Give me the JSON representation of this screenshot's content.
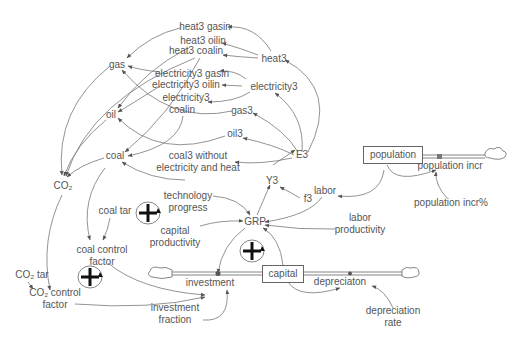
{
  "diagram": {
    "type": "stock-and-flow",
    "colors": {
      "line": "#777777",
      "text": "#555555",
      "stock_border": "#666666",
      "background": "#ffffff"
    },
    "stocks": [
      {
        "id": "population",
        "label": "population"
      },
      {
        "id": "capital",
        "label": "capital"
      }
    ],
    "flows": [
      {
        "id": "population_incr",
        "label": "population incr"
      },
      {
        "id": "investment",
        "label": "investment"
      },
      {
        "id": "depreciaton",
        "label": "depreciaton"
      }
    ],
    "variables": [
      {
        "id": "heat3_gasin",
        "label": "heat3 gasin"
      },
      {
        "id": "heat3_oilin",
        "label": "heat3 oilin"
      },
      {
        "id": "heat3_coalin",
        "label": "heat3 coalin"
      },
      {
        "id": "heat3",
        "label": "heat3"
      },
      {
        "id": "gas",
        "label": "gas"
      },
      {
        "id": "electricity3_gasin",
        "label": "electricity3 gasin"
      },
      {
        "id": "electricity3_oilin",
        "label": "electricity3 oilin"
      },
      {
        "id": "electricity3",
        "label": "electricity3"
      },
      {
        "id": "electricity3_coalin_1",
        "label": "electricity3"
      },
      {
        "id": "electricity3_coalin_2",
        "label": "coalin"
      },
      {
        "id": "oil",
        "label": "oil"
      },
      {
        "id": "gas3",
        "label": "gas3"
      },
      {
        "id": "oil3",
        "label": "oil3"
      },
      {
        "id": "coal",
        "label": "coal"
      },
      {
        "id": "coal3_1",
        "label": "coal3 without"
      },
      {
        "id": "coal3_2",
        "label": "electricity and heat"
      },
      {
        "id": "E3",
        "label": "E3"
      },
      {
        "id": "CO2",
        "label": "CO₂"
      },
      {
        "id": "Y3",
        "label": "Y3"
      },
      {
        "id": "labor",
        "label": "labor"
      },
      {
        "id": "f3",
        "label": "f3"
      },
      {
        "id": "population_incr_pct",
        "label": "population incr%"
      },
      {
        "id": "tech_1",
        "label": "technology"
      },
      {
        "id": "tech_2",
        "label": "progress"
      },
      {
        "id": "coal_tar",
        "label": "coal tar"
      },
      {
        "id": "GRP",
        "label": "GRP"
      },
      {
        "id": "labor_prod_1",
        "label": "labor"
      },
      {
        "id": "labor_prod_2",
        "label": "productivity"
      },
      {
        "id": "cap_prod_1",
        "label": "capital"
      },
      {
        "id": "cap_prod_2",
        "label": "productivity"
      },
      {
        "id": "coal_cf_1",
        "label": "coal control"
      },
      {
        "id": "coal_cf_2",
        "label": "factor"
      },
      {
        "id": "co2_tar",
        "label": "CO₂ tar"
      },
      {
        "id": "co2_cf_1",
        "label": "CO₂ control"
      },
      {
        "id": "co2_cf_2",
        "label": "factor"
      },
      {
        "id": "inv_frac_1",
        "label": "investment"
      },
      {
        "id": "inv_frac_2",
        "label": "fraction"
      },
      {
        "id": "dep_rate_1",
        "label": "depreciation"
      },
      {
        "id": "dep_rate_2",
        "label": "rate"
      }
    ],
    "loops": [
      {
        "id": "loop1",
        "polarity": "+"
      },
      {
        "id": "loop2",
        "polarity": "+"
      },
      {
        "id": "loop3",
        "polarity": "+"
      }
    ]
  }
}
